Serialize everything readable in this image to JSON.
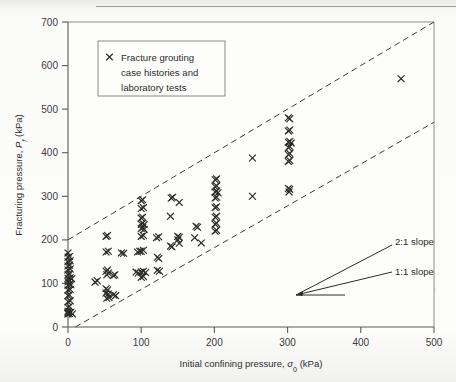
{
  "chart_data": {
    "type": "scatter",
    "title": "",
    "xlabel": "Initial confining pressure, σ₀ (kPa)",
    "ylabel": "Fracturing pressure, P f (kPa)",
    "xlim": [
      0,
      500
    ],
    "ylim": [
      0,
      700
    ],
    "xticks": [
      0,
      100,
      200,
      300,
      400,
      500
    ],
    "yticks": [
      0,
      100,
      200,
      300,
      400,
      500,
      600,
      700
    ],
    "xtick_labels": [
      "0",
      "100",
      "200",
      "300",
      "400",
      "500"
    ],
    "ytick_labels": [
      "0",
      "100",
      "200",
      "300",
      "400",
      "500",
      "600",
      "700"
    ],
    "grid": false,
    "legend_position": "upper-left",
    "series": [
      {
        "name": "Fracture grouting case histories and laboratory tests",
        "marker": "x",
        "color": "#2b2b2b",
        "points": [
          [
            0,
            30
          ],
          [
            0,
            33
          ],
          [
            0,
            36
          ],
          [
            2,
            31
          ],
          [
            4,
            34
          ],
          [
            6,
            30
          ],
          [
            0,
            45
          ],
          [
            2,
            47
          ],
          [
            0,
            58
          ],
          [
            3,
            60
          ],
          [
            0,
            72
          ],
          [
            2,
            74
          ],
          [
            0,
            85
          ],
          [
            3,
            86
          ],
          [
            0,
            96
          ],
          [
            2,
            98
          ],
          [
            4,
            97
          ],
          [
            0,
            104
          ],
          [
            2,
            106
          ],
          [
            0,
            112
          ],
          [
            3,
            113
          ],
          [
            5,
            111
          ],
          [
            0,
            120
          ],
          [
            2,
            122
          ],
          [
            0,
            131
          ],
          [
            3,
            133
          ],
          [
            0,
            140
          ],
          [
            2,
            142
          ],
          [
            0,
            150
          ],
          [
            3,
            152
          ],
          [
            0,
            160
          ],
          [
            2,
            162
          ],
          [
            0,
            170
          ],
          [
            37,
            103
          ],
          [
            40,
            106
          ],
          [
            52,
            208
          ],
          [
            54,
            210
          ],
          [
            52,
            172
          ],
          [
            55,
            174
          ],
          [
            52,
            128
          ],
          [
            54,
            131
          ],
          [
            53,
            120
          ],
          [
            55,
            124
          ],
          [
            52,
            88
          ],
          [
            54,
            85
          ],
          [
            52,
            78
          ],
          [
            55,
            76
          ],
          [
            53,
            66
          ],
          [
            56,
            68
          ],
          [
            62,
            118
          ],
          [
            64,
            120
          ],
          [
            62,
            74
          ],
          [
            65,
            72
          ],
          [
            73,
            170
          ],
          [
            76,
            169
          ],
          [
            93,
            126
          ],
          [
            96,
            124
          ],
          [
            95,
            172
          ],
          [
            98,
            174
          ],
          [
            100,
            290
          ],
          [
            102,
            292
          ],
          [
            100,
            272
          ],
          [
            103,
            274
          ],
          [
            100,
            250
          ],
          [
            102,
            252
          ],
          [
            100,
            236
          ],
          [
            102,
            238
          ],
          [
            104,
            235
          ],
          [
            100,
            226
          ],
          [
            102,
            228
          ],
          [
            104,
            224
          ],
          [
            100,
            208
          ],
          [
            103,
            210
          ],
          [
            100,
            174
          ],
          [
            103,
            176
          ],
          [
            100,
            126
          ],
          [
            103,
            128
          ],
          [
            106,
            125
          ],
          [
            100,
            114
          ],
          [
            103,
            116
          ],
          [
            121,
            205
          ],
          [
            124,
            207
          ],
          [
            122,
            160
          ],
          [
            124,
            157
          ],
          [
            122,
            130
          ],
          [
            125,
            128
          ],
          [
            141,
            296
          ],
          [
            143,
            298
          ],
          [
            140,
            254
          ],
          [
            140,
            186
          ],
          [
            142,
            184
          ],
          [
            152,
            286
          ],
          [
            150,
            208
          ],
          [
            152,
            206
          ],
          [
            150,
            200
          ],
          [
            152,
            192
          ],
          [
            175,
            231
          ],
          [
            177,
            229
          ],
          [
            173,
            205
          ],
          [
            182,
            193
          ],
          [
            201,
            338
          ],
          [
            203,
            340
          ],
          [
            201,
            322
          ],
          [
            203,
            324
          ],
          [
            201,
            310
          ],
          [
            203,
            312
          ],
          [
            205,
            308
          ],
          [
            201,
            296
          ],
          [
            203,
            298
          ],
          [
            201,
            274
          ],
          [
            203,
            276
          ],
          [
            201,
            252
          ],
          [
            203,
            254
          ],
          [
            201,
            236
          ],
          [
            203,
            238
          ],
          [
            201,
            220
          ],
          [
            203,
            222
          ],
          [
            252,
            388
          ],
          [
            252,
            300
          ],
          [
            301,
            480
          ],
          [
            303,
            478
          ],
          [
            301,
            450
          ],
          [
            303,
            452
          ],
          [
            301,
            424
          ],
          [
            303,
            426
          ],
          [
            305,
            422
          ],
          [
            301,
            412
          ],
          [
            303,
            414
          ],
          [
            301,
            396
          ],
          [
            303,
            398
          ],
          [
            301,
            380
          ],
          [
            303,
            382
          ],
          [
            301,
            318
          ],
          [
            303,
            316
          ],
          [
            302,
            310
          ],
          [
            455,
            570
          ]
        ]
      }
    ],
    "reference_lines": [
      {
        "name": "2:1 slope",
        "label": "2:1 slope",
        "style": "dashed",
        "from": [
          0,
          200
        ],
        "to": [
          500,
          700
        ]
      },
      {
        "name": "1:1 slope",
        "label": "1:1 slope",
        "style": "dashed",
        "from": [
          10,
          0
        ],
        "to": [
          500,
          470
        ]
      }
    ],
    "annotations": [
      {
        "name": "slope-2-1-label",
        "text": "2:1 slope",
        "x": 398,
        "y": 225
      },
      {
        "name": "slope-1-1-label",
        "text": "1:1 slope",
        "x": 398,
        "y": 168
      }
    ]
  },
  "legend": {
    "marker": "x-marker",
    "lines": [
      "Fracture grouting",
      "case histories and",
      "laboratory tests"
    ]
  },
  "axes": {
    "x_title": "Initial confining pressure, σ₀ (kPa)",
    "x_title_part1": "Initial confining pressure, ",
    "x_title_sigma": "σ",
    "x_title_sub": "0",
    "x_title_part2": " (kPa)",
    "y_title_part1": "Fracturing pressure, ",
    "y_title_p": "P",
    "y_title_sub": "f",
    "y_title_part2": " (kPa)"
  },
  "colors": {
    "marker": "#2b2b2b",
    "dashed_line": "#3d3d3d",
    "axis": "#5a5a5a",
    "frame": "#8d8d8d",
    "background": "#fcfcfb"
  }
}
